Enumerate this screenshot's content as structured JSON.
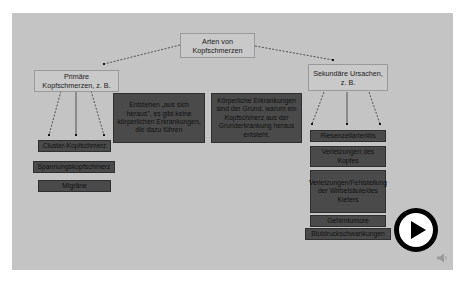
{
  "diagram": {
    "root": {
      "label": "Arten von Kopfschmerzen"
    },
    "primary": {
      "label": "Primäre Kopfschmerzen, z. B.",
      "description": "Entstehen „aus sich heraus\", es gibt keine körperlichen Erkrankungen, die dazu führen",
      "examples": [
        "Cluster-Kopfschmerz",
        "Spannungskopfschmerz",
        "Migräne"
      ]
    },
    "secondary": {
      "label": "Sekundäre Ursachen, z. B.",
      "description": "Körperliche Erkrankungen sind der Grund, warum ein Kopfschmerz aus der Grunderkrankung heraus entsteht.",
      "examples": [
        "Riesenzellarteriitis",
        "Verletzungen des Kopfes",
        "Verletzungen/Fehlstellung der Wirbelsäule/des Kiefers",
        "Gehirntumore",
        "Blutdruckschwankungen"
      ]
    }
  },
  "media": {
    "play_icon": "play-icon",
    "speaker_icon": "speaker-icon"
  },
  "colors": {
    "slide_background": "#c4c4c4",
    "dark_box": "#4a4a4a",
    "play_button": "#000000"
  }
}
